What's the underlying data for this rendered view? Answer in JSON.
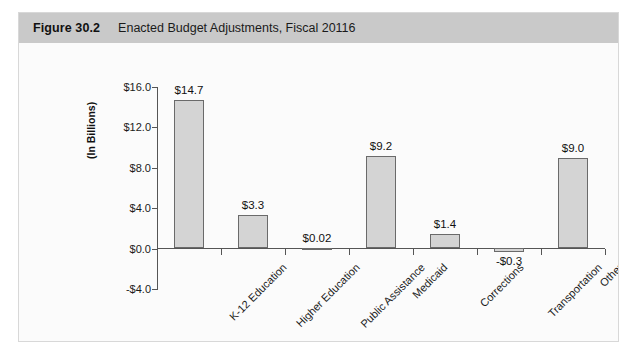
{
  "figure": {
    "number": "Figure 30.2",
    "title": "Enacted Budget Adjustments, Fiscal 20116"
  },
  "colors": {
    "header_band": "#c9c9c9",
    "bar_fill": "#d4d4d4",
    "bar_stroke": "#6a6a6a",
    "axis": "#555555",
    "frame": "#d8d8d8",
    "plot_background": "#fbfbfb"
  },
  "chart_data": {
    "type": "bar",
    "title": "Enacted Budget Adjustments, Fiscal 20116",
    "xlabel": "",
    "ylabel": "(In Billions)",
    "ylim": [
      -4.0,
      16.0
    ],
    "ytick_values": [
      16.0,
      12.0,
      8.0,
      4.0,
      0.0,
      -4.0
    ],
    "ytick_labels": [
      "$16.0",
      "$12.0",
      "$8.0",
      "$4.0",
      "$0.0",
      "-$4.0"
    ],
    "grid": false,
    "legend": null,
    "categories": [
      "K-12 Education",
      "Higher Education",
      "Public Assistance",
      "Medicaid",
      "Corrections",
      "Transportation",
      "Other"
    ],
    "values": [
      14.7,
      3.3,
      0.02,
      9.2,
      1.4,
      -0.3,
      9.0
    ],
    "data_labels": [
      "$14.7",
      "$3.3",
      "$0.02",
      "$9.2",
      "$1.4",
      "-$0.3",
      "$9.0"
    ]
  }
}
